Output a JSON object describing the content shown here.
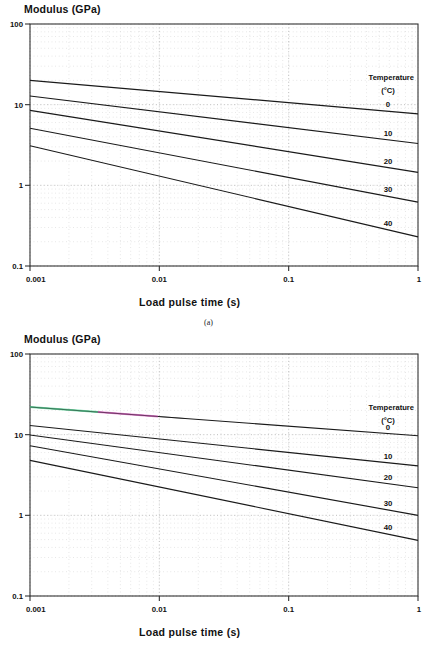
{
  "page": {
    "width": 434,
    "height": 648,
    "background": "#ffffff",
    "ink": "#111111",
    "grid_color": "#c8c8c8",
    "frame_color": "#222222"
  },
  "figures": [
    {
      "id": "a",
      "caption": "(a)",
      "y_axis_title": "Modulus (GPa)",
      "x_axis_title": "Load pulse time (s)",
      "legend_title_line1": "Temperature",
      "legend_title_line2": "(°C)",
      "x_ticks": [
        "0.001",
        "0.01",
        "0.1",
        "1"
      ],
      "y_ticks": [
        "100",
        "10",
        "1",
        "0.1"
      ],
      "curve_labels": [
        "0",
        "10",
        "20",
        "30",
        "40"
      ]
    },
    {
      "id": "b",
      "caption": "",
      "y_axis_title": "Modulus (GPa)",
      "x_axis_title": "Load pulse time (s)",
      "legend_title_line1": "Temperature",
      "legend_title_line2": "(°C)",
      "x_ticks": [
        "0.001",
        "0.01",
        "0.1",
        "1"
      ],
      "y_ticks": [
        "100",
        "10",
        "1",
        "0.1"
      ],
      "curve_labels": [
        "0",
        "10",
        "20",
        "30",
        "40"
      ]
    }
  ],
  "chart_data": [
    {
      "type": "line",
      "id": "a",
      "title": "",
      "xlabel": "Load pulse time (s)",
      "ylabel": "Modulus (GPa)",
      "xscale": "log",
      "yscale": "log",
      "xlim": [
        0.001,
        1
      ],
      "ylim": [
        0.1,
        100
      ],
      "xticks": [
        0.001,
        0.01,
        0.1,
        1
      ],
      "yticks": [
        0.1,
        1,
        10,
        100
      ],
      "grid": true,
      "grid_minor": true,
      "legend_title": "Temperature (°C)",
      "legend_position": "right-inside",
      "x": [
        0.001,
        1
      ],
      "series": [
        {
          "name": "0",
          "values": [
            20.0,
            7.7
          ]
        },
        {
          "name": "10",
          "values": [
            12.8,
            3.3
          ]
        },
        {
          "name": "20",
          "values": [
            8.5,
            1.45
          ]
        },
        {
          "name": "30",
          "values": [
            5.1,
            0.62
          ]
        },
        {
          "name": "40",
          "values": [
            3.1,
            0.23
          ]
        }
      ]
    },
    {
      "type": "line",
      "id": "b",
      "title": "",
      "xlabel": "Load pulse time (s)",
      "ylabel": "Modulus (GPa)",
      "xscale": "log",
      "yscale": "log",
      "xlim": [
        0.001,
        1
      ],
      "ylim": [
        0.1,
        100
      ],
      "xticks": [
        0.001,
        0.01,
        0.1,
        1
      ],
      "yticks": [
        0.1,
        1,
        10,
        100
      ],
      "grid": true,
      "grid_minor": true,
      "legend_title": "Temperature (°C)",
      "legend_position": "right-inside",
      "x": [
        0.001,
        1
      ],
      "series": [
        {
          "name": "0",
          "values": [
            22.0,
            9.7
          ]
        },
        {
          "name": "10",
          "values": [
            13.0,
            4.1
          ]
        },
        {
          "name": "20",
          "values": [
            9.9,
            2.2
          ]
        },
        {
          "name": "30",
          "values": [
            7.3,
            1.0
          ]
        },
        {
          "name": "40",
          "values": [
            4.8,
            0.49
          ]
        }
      ]
    }
  ]
}
